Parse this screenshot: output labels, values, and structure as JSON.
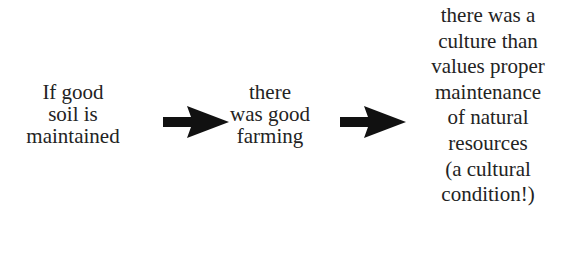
{
  "diagram": {
    "type": "flow",
    "nodes": [
      {
        "id": "cause",
        "lines": [
          "If good",
          "soil is",
          "maintained"
        ]
      },
      {
        "id": "effect",
        "lines": [
          "there",
          "was good",
          "farming"
        ]
      },
      {
        "id": "condition",
        "lines": [
          "there was a",
          "culture than",
          "values proper",
          "maintenance",
          "of natural",
          "resources",
          "(a cultural",
          "condition!)"
        ]
      }
    ],
    "edges": [
      {
        "from": "cause",
        "to": "effect",
        "icon": "right-arrow-icon",
        "color": "#111111"
      },
      {
        "from": "effect",
        "to": "condition",
        "icon": "right-arrow-icon",
        "color": "#111111"
      }
    ]
  }
}
